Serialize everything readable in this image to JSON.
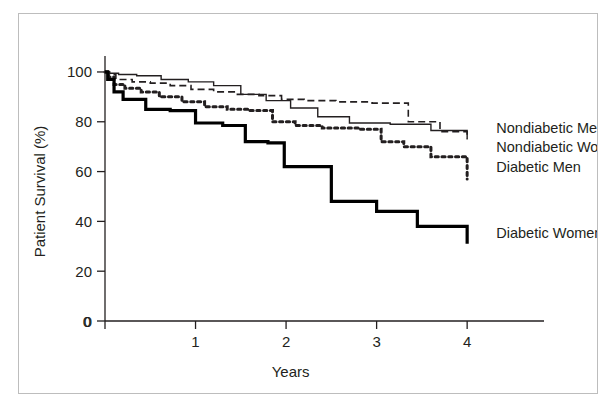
{
  "figure": {
    "frame_color": "#bdbdbd",
    "background": "#ffffff",
    "ink_color": "#231f20"
  },
  "chart_data": {
    "type": "line",
    "subtype": "kaplan-meier-step",
    "title": "",
    "xlabel": "Years",
    "ylabel": "Patient Survival (%)",
    "xlim": [
      0,
      4.65
    ],
    "ylim": [
      0,
      104
    ],
    "xticks": [
      0,
      1,
      2,
      3,
      4
    ],
    "xtick_labels": [
      "0",
      "1",
      "2",
      "3",
      "4"
    ],
    "yticks": [
      0,
      20,
      40,
      60,
      80,
      100
    ],
    "ytick_labels": [
      "0",
      "20",
      "40",
      "60",
      "80",
      "100"
    ],
    "grid": false,
    "legend_position": "right-inline-labels",
    "series": [
      {
        "name": "Nondiabetic Men",
        "style": "dashed",
        "width": 1.6,
        "color": "#231f20",
        "label_x": 4.3,
        "label_y": 77.5,
        "x": [
          0,
          0.05,
          0.12,
          0.3,
          0.5,
          0.72,
          0.95,
          1.2,
          1.45,
          1.7,
          1.95,
          2.2,
          2.55,
          2.95,
          3.35,
          3.7,
          4.0
        ],
        "y": [
          100,
          99,
          97,
          96,
          95.5,
          94.5,
          93,
          92,
          91,
          90.5,
          89,
          88.5,
          88,
          87.5,
          80,
          76,
          73
        ]
      },
      {
        "name": "Nondiabetic Women",
        "style": "solid",
        "width": 1.4,
        "color": "#231f20",
        "label_x": 4.3,
        "label_y": 70.0,
        "x": [
          0,
          0.05,
          0.15,
          0.35,
          0.62,
          0.92,
          1.2,
          1.5,
          1.78,
          2.05,
          2.35,
          2.7,
          3.15,
          3.6,
          4.0
        ],
        "y": [
          100,
          99.5,
          99,
          98.5,
          97,
          96,
          94.5,
          91,
          88.5,
          85.5,
          82,
          79.5,
          79,
          76.5,
          73
        ]
      },
      {
        "name": "Diabetic Men",
        "style": "dotted-heavy",
        "width": 3.0,
        "color": "#231f20",
        "label_x": 4.3,
        "label_y": 62.0,
        "x": [
          0,
          0.04,
          0.1,
          0.22,
          0.4,
          0.6,
          0.85,
          1.1,
          1.35,
          1.6,
          1.85,
          2.1,
          2.4,
          2.8,
          3.05,
          3.3,
          3.6,
          4.0
        ],
        "y": [
          100,
          98,
          95,
          93.5,
          92,
          90,
          88,
          86,
          85,
          84.5,
          80,
          78.5,
          77.5,
          77,
          72,
          70,
          66,
          57
        ]
      },
      {
        "name": "Diabetic Women",
        "style": "solid-heavy",
        "width": 3.2,
        "color": "#000000",
        "label_x": 4.3,
        "label_y": 35.5,
        "x": [
          0,
          0.03,
          0.1,
          0.2,
          0.45,
          0.72,
          1.0,
          1.3,
          1.55,
          1.8,
          1.98,
          2.5,
          3.0,
          3.45,
          4.0
        ],
        "y": [
          100,
          97,
          92,
          89,
          85,
          84.5,
          79.5,
          78.5,
          72,
          71.5,
          62,
          48,
          44,
          38,
          31
        ]
      }
    ],
    "series_labels": [
      "Nondiabetic Men",
      "Nondiabetic Women",
      "Diabetic Men",
      "Diabetic Women"
    ]
  }
}
